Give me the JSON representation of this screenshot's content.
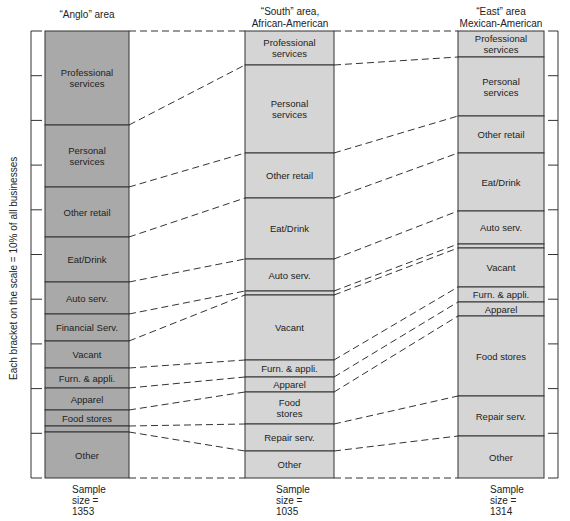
{
  "axis": {
    "label": "Each bracket on the scale = 10% of all businesses",
    "top": 31,
    "bottom": 478,
    "brackets": 10
  },
  "colors": {
    "anglo_fill": "#a9a9a9",
    "other_fill": "#d5d5d5",
    "stroke": "#333333",
    "connector": "#333333"
  },
  "columns": [
    {
      "id": "anglo",
      "title": [
        "“Anglo” area"
      ],
      "x": 45,
      "width": 84,
      "fill": "#a9a9a9",
      "sample": [
        "Sample",
        "size =",
        "1353"
      ],
      "segments": [
        {
          "key": "prof",
          "label": [
            "Professional",
            "services"
          ],
          "y0": 31,
          "y1": 125
        },
        {
          "key": "pers",
          "label": [
            "Personal",
            "services"
          ],
          "y0": 125,
          "y1": 187
        },
        {
          "key": "oret",
          "label": [
            "Other retail"
          ],
          "y0": 187,
          "y1": 237
        },
        {
          "key": "eat",
          "label": [
            "Eat/Drink"
          ],
          "y0": 237,
          "y1": 282
        },
        {
          "key": "auto",
          "label": [
            "Auto serv."
          ],
          "y0": 282,
          "y1": 314
        },
        {
          "key": "fin",
          "label": [
            "Financial Serv."
          ],
          "y0": 314,
          "y1": 341
        },
        {
          "key": "vac",
          "label": [
            "Vacant"
          ],
          "y0": 341,
          "y1": 368
        },
        {
          "key": "furn",
          "label": [
            "Furn. & appli."
          ],
          "y0": 368,
          "y1": 388
        },
        {
          "key": "app",
          "label": [
            "Apparel"
          ],
          "y0": 388,
          "y1": 410
        },
        {
          "key": "food",
          "label": [
            "Food stores"
          ],
          "y0": 410,
          "y1": 426
        },
        {
          "key": "rep",
          "label": [],
          "y0": 426,
          "y1": 432
        },
        {
          "key": "oth",
          "label": [
            "Other"
          ],
          "y0": 432,
          "y1": 478
        }
      ]
    },
    {
      "id": "south",
      "title": [
        "“South” area,",
        "African-American"
      ],
      "x": 245,
      "width": 89,
      "fill": "#d5d5d5",
      "sample": [
        "Sample",
        "size =",
        "1035"
      ],
      "segments": [
        {
          "key": "prof",
          "label": [
            "Professional",
            "services"
          ],
          "y0": 31,
          "y1": 65
        },
        {
          "key": "pers",
          "label": [
            "Personal",
            "services"
          ],
          "y0": 65,
          "y1": 153
        },
        {
          "key": "oret",
          "label": [
            "Other retail"
          ],
          "y0": 153,
          "y1": 198
        },
        {
          "key": "eat",
          "label": [
            "Eat/Drink"
          ],
          "y0": 198,
          "y1": 259
        },
        {
          "key": "auto",
          "label": [
            "Auto serv."
          ],
          "y0": 259,
          "y1": 291
        },
        {
          "key": "fin",
          "label": [],
          "y0": 291,
          "y1": 295
        },
        {
          "key": "vac",
          "label": [
            "Vacant"
          ],
          "y0": 295,
          "y1": 360
        },
        {
          "key": "furn",
          "label": [
            "Furn. & appli."
          ],
          "y0": 360,
          "y1": 377
        },
        {
          "key": "app",
          "label": [
            "Apparel"
          ],
          "y0": 377,
          "y1": 392
        },
        {
          "key": "food",
          "label": [
            "Food",
            "stores"
          ],
          "y0": 392,
          "y1": 424
        },
        {
          "key": "rep",
          "label": [
            "Repair serv."
          ],
          "y0": 424,
          "y1": 451
        },
        {
          "key": "oth",
          "label": [
            "Other"
          ],
          "y0": 451,
          "y1": 478
        }
      ]
    },
    {
      "id": "east",
      "title": [
        "“East” area",
        "Mexican-American"
      ],
      "x": 458,
      "width": 86,
      "fill": "#d5d5d5",
      "sample": [
        "Sample",
        "size =",
        "1314"
      ],
      "segments": [
        {
          "key": "prof",
          "label": [
            "Professional",
            "services"
          ],
          "y0": 31,
          "y1": 57
        },
        {
          "key": "pers",
          "label": [
            "Personal",
            "services"
          ],
          "y0": 57,
          "y1": 116
        },
        {
          "key": "oret",
          "label": [
            "Other retail"
          ],
          "y0": 116,
          "y1": 153
        },
        {
          "key": "eat",
          "label": [
            "Eat/Drink"
          ],
          "y0": 153,
          "y1": 211
        },
        {
          "key": "auto",
          "label": [
            "Auto serv."
          ],
          "y0": 211,
          "y1": 244
        },
        {
          "key": "fin",
          "label": [],
          "y0": 244,
          "y1": 248
        },
        {
          "key": "vac",
          "label": [
            "Vacant"
          ],
          "y0": 248,
          "y1": 287
        },
        {
          "key": "furn",
          "label": [
            "Furn. & appli."
          ],
          "y0": 287,
          "y1": 302
        },
        {
          "key": "app",
          "label": [
            "Apparel"
          ],
          "y0": 302,
          "y1": 316
        },
        {
          "key": "food",
          "label": [
            "Food stores"
          ],
          "y0": 316,
          "y1": 396
        },
        {
          "key": "rep",
          "label": [
            "Repair serv."
          ],
          "y0": 396,
          "y1": 436
        },
        {
          "key": "oth",
          "label": [
            "Other"
          ],
          "y0": 436,
          "y1": 478
        }
      ]
    }
  ]
}
